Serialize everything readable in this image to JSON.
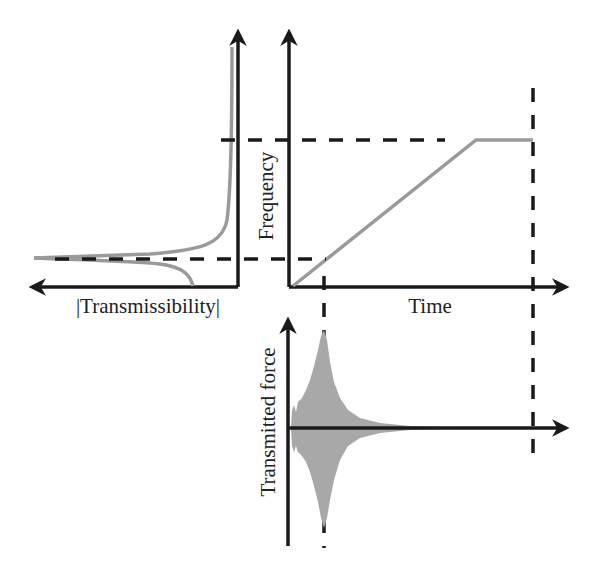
{
  "diagram": {
    "type": "frequency-sweep-transmissibility",
    "panels": {
      "transmissibility": {
        "axis_label": "|Transmissibility|",
        "axis_direction": "leftward"
      },
      "frequency_time": {
        "y_label": "Frequency",
        "x_label": "Time",
        "curve": "linear ramp then constant plateau"
      },
      "transmitted_force": {
        "y_label": "Transmitted force",
        "curve": "oscillation with peak amplitude at resonance time, decaying afterwards"
      }
    },
    "guides": {
      "resonance_frequency_line": "dashed horizontal",
      "final_frequency_line": "dashed horizontal",
      "resonance_time_line": "dashed vertical",
      "sweep_end_line": "dashed vertical"
    }
  },
  "colors": {
    "axis": "#1a1a1a",
    "curve": "#9a9a9a",
    "fill": "#a8a8a8",
    "text": "#222222"
  }
}
